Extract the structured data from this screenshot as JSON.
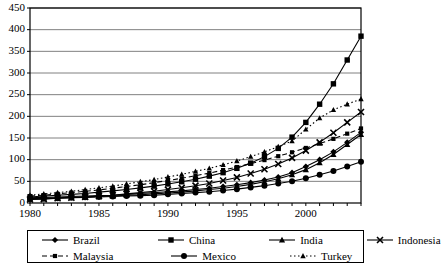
{
  "chart_data": {
    "type": "line",
    "title": "",
    "xlabel": "",
    "ylabel": "",
    "xlim": [
      1980,
      2004
    ],
    "ylim": [
      0,
      450
    ],
    "ytick_step": 50,
    "yticks": [
      0,
      50,
      100,
      150,
      200,
      250,
      300,
      350,
      400,
      450
    ],
    "xticks": [
      1980,
      1985,
      1990,
      1995,
      2000
    ],
    "x": [
      1980,
      1981,
      1982,
      1983,
      1984,
      1985,
      1986,
      1987,
      1988,
      1989,
      1990,
      1991,
      1992,
      1993,
      1994,
      1995,
      1996,
      1997,
      1998,
      1999,
      2000,
      2001,
      2002,
      2003,
      2004
    ],
    "grid": "horizontal",
    "legend_position": "bottom",
    "series": [
      {
        "name": "Brazil",
        "marker": "diamond",
        "line": "solid",
        "color": "#000000",
        "values": [
          12,
          13,
          14,
          15,
          16,
          17,
          18,
          20,
          22,
          24,
          26,
          28,
          31,
          34,
          38,
          42,
          47,
          53,
          60,
          70,
          84,
          100,
          118,
          140,
          163
        ]
      },
      {
        "name": "China",
        "marker": "square",
        "line": "solid",
        "color": "#000000",
        "values": [
          14,
          16,
          18,
          20,
          22,
          25,
          28,
          31,
          35,
          39,
          44,
          49,
          55,
          62,
          70,
          80,
          92,
          107,
          126,
          152,
          186,
          228,
          275,
          330,
          385
        ]
      },
      {
        "name": "India",
        "marker": "triangle",
        "line": "solid",
        "color": "#000000",
        "values": [
          10,
          11,
          12,
          13,
          14,
          15,
          16,
          18,
          19,
          21,
          23,
          25,
          28,
          31,
          34,
          38,
          43,
          49,
          56,
          65,
          77,
          93,
          112,
          135,
          158
        ]
      },
      {
        "name": "Indonesia",
        "marker": "cross",
        "line": "solid",
        "color": "#000000",
        "values": [
          8,
          9,
          11,
          12,
          14,
          16,
          18,
          21,
          24,
          27,
          31,
          35,
          40,
          45,
          52,
          59,
          68,
          78,
          90,
          104,
          121,
          140,
          162,
          186,
          210
        ]
      },
      {
        "name": "Malaysia",
        "marker": "square-small",
        "line": "dashed",
        "color": "#000000",
        "values": [
          16,
          18,
          21,
          24,
          27,
          30,
          34,
          38,
          42,
          47,
          52,
          57,
          63,
          69,
          76,
          83,
          91,
          99,
          108,
          117,
          127,
          137,
          148,
          160,
          172
        ]
      },
      {
        "name": "Mexico",
        "marker": "circle",
        "line": "solid",
        "color": "#000000",
        "values": [
          9,
          10,
          11,
          12,
          13,
          14,
          15,
          16,
          17,
          18,
          20,
          22,
          24,
          26,
          29,
          32,
          36,
          40,
          45,
          50,
          57,
          65,
          74,
          84,
          95
        ]
      },
      {
        "name": "Turkey",
        "marker": "triangle-small",
        "line": "dotted",
        "color": "#000000",
        "values": [
          18,
          21,
          24,
          27,
          31,
          35,
          39,
          44,
          49,
          54,
          60,
          66,
          73,
          80,
          88,
          97,
          107,
          118,
          130,
          143,
          170,
          196,
          215,
          228,
          240
        ]
      }
    ]
  },
  "legend": {
    "rows": [
      [
        {
          "label": "Brazil",
          "marker": "diamond",
          "line": "solid"
        },
        {
          "label": "China",
          "marker": "square",
          "line": "solid"
        },
        {
          "label": "India",
          "marker": "triangle",
          "line": "solid"
        },
        {
          "label": "Indonesia",
          "marker": "cross",
          "line": "solid"
        }
      ],
      [
        {
          "label": "Malaysia",
          "marker": "square-small",
          "line": "dashed"
        },
        {
          "label": "Mexico",
          "marker": "circle",
          "line": "solid"
        },
        {
          "label": "Turkey",
          "marker": "triangle-small",
          "line": "dotted"
        }
      ]
    ]
  }
}
